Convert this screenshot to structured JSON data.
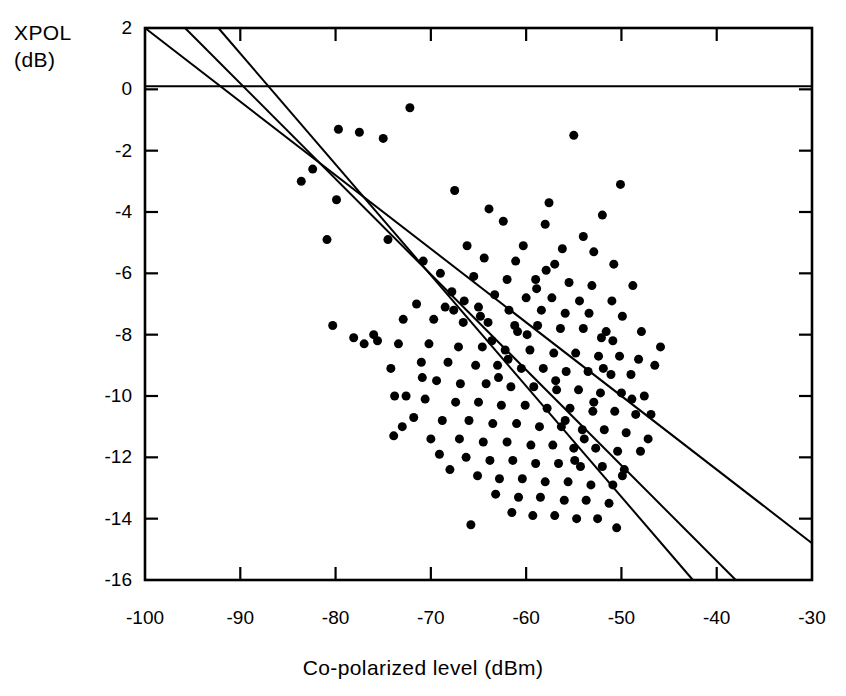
{
  "chart_data": {
    "type": "scatter",
    "title": "",
    "xlabel": "Co-polarized level (dBm)",
    "ylabel": "XPOL (dB)",
    "ylabel_lines": [
      "XPOL",
      "(dB)"
    ],
    "xlim": [
      -100,
      -30
    ],
    "ylim": [
      -16,
      2
    ],
    "xticks": [
      -100,
      -90,
      -80,
      -70,
      -60,
      -50,
      -40,
      -30
    ],
    "yticks": [
      2,
      0,
      -2,
      -4,
      -6,
      -8,
      -10,
      -12,
      -14,
      -16
    ],
    "xtick_labels": [
      "-100",
      "-90",
      "-80",
      "-70",
      "-60",
      "-50",
      "-40",
      "-30"
    ],
    "ytick_labels": [
      "2",
      "0",
      "-2",
      "-4",
      "-6",
      "-8",
      "-10",
      "-12",
      "-14",
      "-16"
    ],
    "grid": false,
    "legend": null,
    "marker": "filled-circle",
    "marker_color": "#000000",
    "marker_size_px": 9,
    "line_color": "#000000",
    "frame_color": "#000000",
    "reference_lines": [
      {
        "name": "zero-db-reference",
        "type": "horizontal",
        "y": 0.1,
        "x_from": -100,
        "x_to": -30
      }
    ],
    "fit_lines": [
      {
        "name": "fit-line-upper",
        "x_from": -100,
        "y_from": 2.0,
        "x_to": -30,
        "y_to": -14.8
      },
      {
        "name": "fit-line-middle",
        "x_from": -95.8,
        "y_from": 2.0,
        "x_to": -38.0,
        "y_to": -16.0
      },
      {
        "name": "fit-line-lower",
        "x_from": -92.3,
        "y_from": 2.0,
        "x_to": -42.5,
        "y_to": -16.0
      }
    ],
    "points": [
      [
        -72.2,
        -0.6
      ],
      [
        -79.7,
        -1.3
      ],
      [
        -77.5,
        -1.4
      ],
      [
        -55.0,
        -1.5
      ],
      [
        -75.0,
        -1.6
      ],
      [
        -82.4,
        -2.6
      ],
      [
        -50.1,
        -3.1
      ],
      [
        -83.6,
        -3.0
      ],
      [
        -67.5,
        -3.3
      ],
      [
        -79.9,
        -3.6
      ],
      [
        -57.6,
        -3.7
      ],
      [
        -63.9,
        -3.9
      ],
      [
        -52.0,
        -4.1
      ],
      [
        -62.4,
        -4.3
      ],
      [
        -58.0,
        -4.4
      ],
      [
        -80.9,
        -4.9
      ],
      [
        -54.0,
        -4.8
      ],
      [
        -74.5,
        -4.9
      ],
      [
        -66.2,
        -5.1
      ],
      [
        -60.3,
        -5.1
      ],
      [
        -56.2,
        -5.2
      ],
      [
        -52.9,
        -5.3
      ],
      [
        -70.8,
        -5.6
      ],
      [
        -64.4,
        -5.5
      ],
      [
        -61.1,
        -5.6
      ],
      [
        -57.0,
        -5.7
      ],
      [
        -50.8,
        -5.7
      ],
      [
        -69.0,
        -6.0
      ],
      [
        -65.5,
        -6.1
      ],
      [
        -62.0,
        -6.2
      ],
      [
        -59.0,
        -6.2
      ],
      [
        -55.5,
        -6.3
      ],
      [
        -53.1,
        -6.4
      ],
      [
        -48.8,
        -6.4
      ],
      [
        -67.8,
        -6.6
      ],
      [
        -63.3,
        -6.7
      ],
      [
        -60.0,
        -6.8
      ],
      [
        -57.3,
        -6.8
      ],
      [
        -54.4,
        -6.9
      ],
      [
        -51.0,
        -6.9
      ],
      [
        -71.5,
        -7.0
      ],
      [
        -68.5,
        -7.1
      ],
      [
        -65.0,
        -7.1
      ],
      [
        -61.8,
        -7.2
      ],
      [
        -58.4,
        -7.2
      ],
      [
        -55.9,
        -7.3
      ],
      [
        -53.4,
        -7.3
      ],
      [
        -49.9,
        -7.4
      ],
      [
        -72.9,
        -7.5
      ],
      [
        -69.7,
        -7.5
      ],
      [
        -66.6,
        -7.6
      ],
      [
        -64.0,
        -7.6
      ],
      [
        -61.2,
        -7.7
      ],
      [
        -58.8,
        -7.7
      ],
      [
        -56.4,
        -7.8
      ],
      [
        -54.0,
        -7.8
      ],
      [
        -51.6,
        -7.9
      ],
      [
        -47.9,
        -7.9
      ],
      [
        -80.3,
        -7.7
      ],
      [
        -78.1,
        -8.1
      ],
      [
        -75.6,
        -8.2
      ],
      [
        -73.4,
        -8.3
      ],
      [
        -70.2,
        -8.3
      ],
      [
        -67.1,
        -8.4
      ],
      [
        -64.6,
        -8.4
      ],
      [
        -62.2,
        -8.5
      ],
      [
        -59.6,
        -8.5
      ],
      [
        -57.1,
        -8.6
      ],
      [
        -54.8,
        -8.6
      ],
      [
        -52.4,
        -8.7
      ],
      [
        -50.2,
        -8.7
      ],
      [
        -48.2,
        -8.8
      ],
      [
        -71.0,
        -8.9
      ],
      [
        -68.2,
        -8.9
      ],
      [
        -65.3,
        -9.0
      ],
      [
        -63.0,
        -9.0
      ],
      [
        -60.5,
        -9.1
      ],
      [
        -58.2,
        -9.1
      ],
      [
        -55.8,
        -9.2
      ],
      [
        -53.5,
        -9.2
      ],
      [
        -51.1,
        -9.3
      ],
      [
        -49.0,
        -9.3
      ],
      [
        -69.4,
        -9.5
      ],
      [
        -66.9,
        -9.6
      ],
      [
        -64.2,
        -9.6
      ],
      [
        -61.6,
        -9.7
      ],
      [
        -59.2,
        -9.7
      ],
      [
        -56.8,
        -9.8
      ],
      [
        -54.5,
        -9.8
      ],
      [
        -52.2,
        -9.9
      ],
      [
        -50.0,
        -9.9
      ],
      [
        -47.6,
        -10.0
      ],
      [
        -73.8,
        -10.0
      ],
      [
        -70.6,
        -10.1
      ],
      [
        -67.4,
        -10.2
      ],
      [
        -65.0,
        -10.2
      ],
      [
        -62.6,
        -10.3
      ],
      [
        -60.1,
        -10.3
      ],
      [
        -57.8,
        -10.4
      ],
      [
        -55.4,
        -10.4
      ],
      [
        -53.0,
        -10.5
      ],
      [
        -50.7,
        -10.5
      ],
      [
        -48.5,
        -10.6
      ],
      [
        -71.8,
        -10.7
      ],
      [
        -68.8,
        -10.8
      ],
      [
        -66.0,
        -10.8
      ],
      [
        -63.5,
        -10.9
      ],
      [
        -61.0,
        -10.9
      ],
      [
        -58.6,
        -11.0
      ],
      [
        -56.3,
        -11.0
      ],
      [
        -54.1,
        -11.1
      ],
      [
        -51.8,
        -11.1
      ],
      [
        -49.5,
        -11.2
      ],
      [
        -73.9,
        -11.3
      ],
      [
        -70.0,
        -11.4
      ],
      [
        -67.0,
        -11.4
      ],
      [
        -64.5,
        -11.5
      ],
      [
        -62.0,
        -11.5
      ],
      [
        -59.5,
        -11.6
      ],
      [
        -57.2,
        -11.6
      ],
      [
        -55.0,
        -11.7
      ],
      [
        -52.7,
        -11.7
      ],
      [
        -50.4,
        -11.8
      ],
      [
        -48.0,
        -11.8
      ],
      [
        -66.3,
        -12.0
      ],
      [
        -63.8,
        -12.1
      ],
      [
        -61.4,
        -12.1
      ],
      [
        -59.0,
        -12.2
      ],
      [
        -56.6,
        -12.2
      ],
      [
        -54.3,
        -12.3
      ],
      [
        -52.0,
        -12.3
      ],
      [
        -49.7,
        -12.4
      ],
      [
        -65.1,
        -12.6
      ],
      [
        -62.8,
        -12.7
      ],
      [
        -60.4,
        -12.7
      ],
      [
        -58.0,
        -12.8
      ],
      [
        -55.6,
        -12.8
      ],
      [
        -53.2,
        -12.9
      ],
      [
        -50.9,
        -12.9
      ],
      [
        -63.2,
        -13.2
      ],
      [
        -60.8,
        -13.3
      ],
      [
        -58.5,
        -13.3
      ],
      [
        -56.0,
        -13.4
      ],
      [
        -53.7,
        -13.4
      ],
      [
        -51.3,
        -13.5
      ],
      [
        -61.5,
        -13.8
      ],
      [
        -59.3,
        -13.9
      ],
      [
        -57.0,
        -13.9
      ],
      [
        -54.7,
        -14.0
      ],
      [
        -52.5,
        -14.0
      ],
      [
        -65.8,
        -14.2
      ],
      [
        -50.5,
        -14.3
      ],
      [
        -72.6,
        -10.0
      ],
      [
        -73.0,
        -11.0
      ],
      [
        -76.0,
        -8.0
      ],
      [
        -70.9,
        -9.4
      ],
      [
        -74.2,
        -9.1
      ],
      [
        -77.0,
        -8.3
      ],
      [
        -69.1,
        -11.9
      ],
      [
        -68.0,
        -12.4
      ],
      [
        -46.5,
        -9.0
      ],
      [
        -46.9,
        -10.6
      ],
      [
        -47.2,
        -11.4
      ],
      [
        -45.9,
        -8.4
      ],
      [
        -67.6,
        -7.2
      ],
      [
        -66.5,
        -6.9
      ],
      [
        -64.8,
        -7.4
      ],
      [
        -63.6,
        -8.2
      ],
      [
        -62.9,
        -9.4
      ],
      [
        -61.9,
        -8.8
      ],
      [
        -60.9,
        -7.9
      ],
      [
        -59.9,
        -8.0
      ],
      [
        -58.9,
        -6.5
      ],
      [
        -57.9,
        -5.9
      ],
      [
        -56.9,
        -9.5
      ],
      [
        -55.9,
        -10.8
      ],
      [
        -54.9,
        -12.1
      ],
      [
        -53.9,
        -11.4
      ],
      [
        -52.9,
        -10.2
      ],
      [
        -51.9,
        -9.1
      ],
      [
        -50.9,
        -8.2
      ],
      [
        -49.9,
        -12.6
      ],
      [
        -48.9,
        -10.1
      ],
      [
        -52.1,
        -8.1
      ]
    ]
  }
}
